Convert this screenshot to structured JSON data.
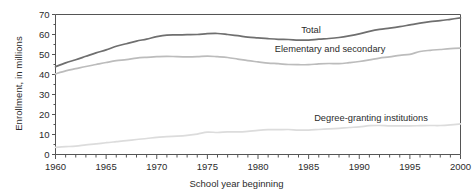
{
  "chart_data": {
    "type": "line",
    "title": "",
    "xlabel": "School year beginning",
    "ylabel": "Enrollment, in millions",
    "xlim": [
      1960,
      2000
    ],
    "ylim": [
      0,
      70
    ],
    "grid": false,
    "legend_position": "inline-annotations",
    "x_ticks_major": [
      1960,
      1965,
      1970,
      1975,
      1980,
      1985,
      1990,
      1995,
      2000
    ],
    "x_tick_labels": [
      "1960",
      "1965",
      "1970",
      "1975",
      "1980",
      "1985",
      "1990",
      "1995",
      "2000"
    ],
    "x_minor_tick_interval": 1,
    "y_ticks": [
      0,
      10,
      20,
      30,
      40,
      50,
      60,
      70
    ],
    "y_tick_labels": [
      "0",
      "10",
      "20",
      "30",
      "40",
      "50",
      "60",
      "70"
    ],
    "x": [
      1960,
      1961,
      1962,
      1963,
      1964,
      1965,
      1966,
      1967,
      1968,
      1969,
      1970,
      1971,
      1972,
      1973,
      1974,
      1975,
      1976,
      1977,
      1978,
      1979,
      1980,
      1981,
      1982,
      1983,
      1984,
      1985,
      1986,
      1987,
      1988,
      1989,
      1990,
      1991,
      1992,
      1993,
      1994,
      1995,
      1996,
      1997,
      1998,
      1999,
      2000
    ],
    "series": [
      {
        "name": "Total",
        "color": "#6f6f6f",
        "values": [
          43.9,
          45.8,
          47.4,
          49.1,
          50.8,
          52.3,
          54.1,
          55.4,
          56.7,
          57.7,
          58.9,
          59.7,
          59.8,
          59.9,
          60.0,
          60.4,
          60.5,
          60.0,
          59.4,
          58.7,
          58.3,
          57.9,
          57.6,
          57.5,
          57.2,
          57.2,
          57.7,
          58.0,
          58.5,
          59.3,
          60.3,
          61.6,
          62.6,
          63.2,
          63.9,
          64.8,
          65.7,
          66.4,
          66.9,
          67.6,
          68.3
        ]
      },
      {
        "name": "Elementary and secondary",
        "color": "#bcbcbc",
        "values": [
          40.3,
          41.8,
          42.9,
          44.0,
          45.0,
          46.0,
          46.9,
          47.4,
          48.2,
          48.6,
          48.9,
          49.1,
          48.9,
          48.8,
          48.9,
          49.2,
          48.9,
          48.5,
          47.7,
          46.9,
          46.3,
          45.7,
          45.4,
          45.0,
          44.9,
          44.9,
          45.3,
          45.5,
          45.4,
          45.9,
          46.5,
          47.3,
          48.2,
          48.8,
          49.6,
          50.1,
          51.5,
          52.1,
          52.5,
          52.9,
          53.2
        ]
      },
      {
        "name": "Degree-granting institutions",
        "color": "#dcdcdc",
        "values": [
          3.6,
          3.9,
          4.2,
          4.8,
          5.3,
          5.9,
          6.4,
          6.9,
          7.5,
          8.0,
          8.6,
          8.9,
          9.2,
          9.6,
          10.2,
          11.2,
          11.0,
          11.3,
          11.3,
          11.6,
          12.1,
          12.4,
          12.4,
          12.5,
          12.2,
          12.2,
          12.5,
          12.8,
          13.1,
          13.5,
          13.8,
          14.4,
          14.5,
          14.3,
          14.3,
          14.3,
          14.4,
          14.5,
          14.5,
          14.8,
          15.3
        ]
      }
    ],
    "annotations": [
      {
        "label": "Total",
        "x_px": 311,
        "y_px": 33
      },
      {
        "label": "Elementary and secondary",
        "x_px": 330,
        "y_px": 52
      },
      {
        "label": "Degree-granting institutions",
        "x_px": 371,
        "y_px": 121
      }
    ]
  }
}
